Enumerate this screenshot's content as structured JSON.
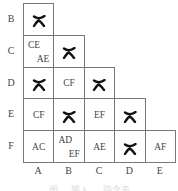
{
  "diagram": {
    "rows": [
      "B",
      "C",
      "D",
      "E",
      "F"
    ],
    "cols": [
      "A",
      "B",
      "C",
      "D",
      "E"
    ],
    "cells": [
      {
        "row": 0,
        "col": 0,
        "type": "x"
      },
      {
        "row": 1,
        "col": 0,
        "type": "pair",
        "top": "CE",
        "bottom": "AE"
      },
      {
        "row": 1,
        "col": 1,
        "type": "x"
      },
      {
        "row": 2,
        "col": 0,
        "type": "x"
      },
      {
        "row": 2,
        "col": 1,
        "type": "text",
        "text": "CF"
      },
      {
        "row": 2,
        "col": 2,
        "type": "x"
      },
      {
        "row": 3,
        "col": 0,
        "type": "text",
        "text": "CF"
      },
      {
        "row": 3,
        "col": 1,
        "type": "x"
      },
      {
        "row": 3,
        "col": 2,
        "type": "text",
        "text": "EF"
      },
      {
        "row": 3,
        "col": 3,
        "type": "x"
      },
      {
        "row": 4,
        "col": 0,
        "type": "text",
        "text": "AC"
      },
      {
        "row": 4,
        "col": 1,
        "type": "pair",
        "top": "AD",
        "bottom": "EF"
      },
      {
        "row": 4,
        "col": 2,
        "type": "text",
        "text": "AE"
      },
      {
        "row": 4,
        "col": 3,
        "type": "x"
      },
      {
        "row": 4,
        "col": 4,
        "type": "text",
        "text": "AF"
      }
    ],
    "caption": "图 — 输入 — 隐含表"
  }
}
